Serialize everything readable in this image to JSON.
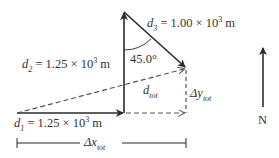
{
  "vectors": {
    "d1": {
      "symbol": "d",
      "sub": "1",
      "value": "= 1.25 × 10",
      "exp": "3",
      "unit": " m",
      "direction": "east"
    },
    "d2": {
      "symbol": "d",
      "sub": "2",
      "value": "= 1.25 × 10",
      "exp": "3",
      "unit": " m",
      "direction": "north"
    },
    "d3": {
      "symbol": "d",
      "sub": "3",
      "value": "= 1.00 × 10",
      "exp": "3",
      "unit": " m",
      "direction": "southeast"
    },
    "dtot": {
      "symbol": "d",
      "sub": "tot"
    }
  },
  "angle": {
    "label": "45.0°"
  },
  "components": {
    "dx": {
      "symbol": "Δx",
      "sub": "tot"
    },
    "dy": {
      "symbol": "Δy",
      "sub": "tot"
    }
  },
  "compass": {
    "label": "N"
  },
  "colors": {
    "line": "#2b2b2b",
    "dashed": "#555555"
  }
}
